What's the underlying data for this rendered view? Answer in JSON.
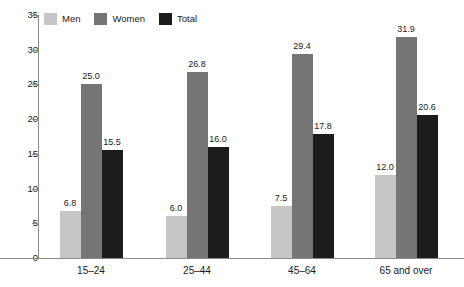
{
  "chart_data": {
    "type": "bar",
    "title": "",
    "subtitle": "",
    "xlabel": "",
    "ylabel": "",
    "ylim": [
      0,
      35
    ],
    "ytick_step": 5,
    "yticks": [
      "0",
      "5",
      "10",
      "15",
      "20",
      "25",
      "30",
      "35"
    ],
    "grid": false,
    "legend_position": "top-left",
    "categories": [
      "15–24",
      "25–44",
      "45–64",
      "65 and over"
    ],
    "series": [
      {
        "name": "Men",
        "color": "#c6c6c6",
        "values": [
          6.8,
          6.0,
          7.5,
          12.0
        ],
        "labels": [
          "6.8",
          "6.0",
          "7.5",
          "12.0"
        ]
      },
      {
        "name": "Women",
        "color": "#757575",
        "values": [
          25.0,
          26.8,
          29.4,
          31.9
        ],
        "labels": [
          "25.0",
          "26.8",
          "29.4",
          "31.9"
        ]
      },
      {
        "name": "Total",
        "color": "#1c1c1c",
        "values": [
          15.5,
          16.0,
          17.8,
          20.6
        ],
        "labels": [
          "15.5",
          "16.0",
          "17.8",
          "20.6"
        ]
      }
    ]
  },
  "legend": {
    "items": [
      {
        "label": "Men",
        "color": "#c6c6c6"
      },
      {
        "label": "Women",
        "color": "#757575"
      },
      {
        "label": "Total",
        "color": "#1c1c1c"
      }
    ]
  },
  "axis": {
    "y_labels": [
      "35",
      "30",
      "25",
      "20",
      "15",
      "10",
      "5",
      "0"
    ],
    "x_labels": [
      "15–24",
      "25–44",
      "45–64",
      "65 and over"
    ]
  },
  "colors": {
    "axis": "#8a8a8a",
    "text": "#1a1a1a",
    "background": "#ffffff",
    "men": "#c6c6c6",
    "women": "#757575",
    "total": "#1c1c1c"
  }
}
